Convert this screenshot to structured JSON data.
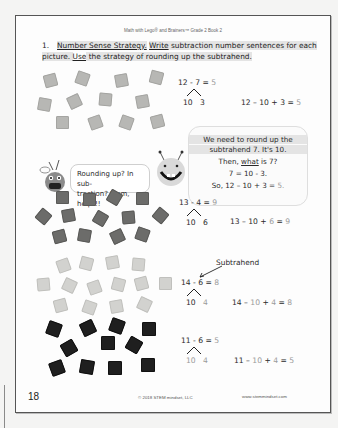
{
  "page": {
    "header": "Math with Lego® and Brainers™ Grade 2 Book 2",
    "page_number": "18",
    "copyright": "© 2018 STEM mindset, LLC",
    "website": "www.stemmindset.com"
  },
  "instruction": {
    "number": "1.",
    "title": "Number Sense Strategy.",
    "verb_write": "Write",
    "text_part1": " subtraction number sentences for each picture. ",
    "verb_use": "Use",
    "text_part2": " the strategy of rounding up the subtrahend."
  },
  "problems": [
    {
      "tile_color": "light",
      "tile_count": 12,
      "equation": "12 - 7 =",
      "answer": "5",
      "split_left": "10",
      "split_right": "3",
      "rewrite_prefix": "12 – 10 + 3 =",
      "rewrite_answer": "5"
    },
    {
      "tile_color": "dark",
      "tile_count": 13,
      "equation": "13 - 4 =",
      "answer": "9",
      "split_left": "10",
      "split_right": "6",
      "rewrite_prefix": "13 – 10 +",
      "rewrite_gray": "6",
      "rewrite_eq": "=",
      "rewrite_answer": "9"
    },
    {
      "tile_color": "pale",
      "tile_count": 14,
      "label": "Subtrahend",
      "equation": "14 - 6 =",
      "answer": "8",
      "split_left": "10",
      "split_right": "4",
      "rewrite_prefix": "14 –",
      "rewrite_gray1": "10",
      "rewrite_plus": "+",
      "rewrite_gray2": "4",
      "rewrite_eq": "=",
      "rewrite_answer": "8"
    },
    {
      "tile_color": "black",
      "tile_count": 11,
      "equation": "11 - 6 =",
      "answer": "5",
      "split_left": "10",
      "split_right": "4",
      "rewrite_prefix": "11 –",
      "rewrite_gray1": "10",
      "rewrite_plus": "+",
      "rewrite_gray2": "4",
      "rewrite_eq": "=",
      "rewrite_answer": "5"
    }
  ],
  "speech_bubbles": {
    "left": {
      "line1": "Rounding up? In sub-",
      "line2": "traction? Mom, help!!!"
    },
    "right": {
      "line1": "We need to round up the",
      "line2": "subtrahend 7. It's 10.",
      "line3_pre": "Then, ",
      "line3_u": "what",
      "line3_post": " is 7?",
      "line4": "7 = 10 - 3.",
      "line5_pre": "So, 12 – 10 + 3 =",
      "line5_ans": "5."
    }
  },
  "colors": {
    "answer_gray": "#9a9a9a",
    "text": "#2a2a2a",
    "border": "#555555"
  }
}
